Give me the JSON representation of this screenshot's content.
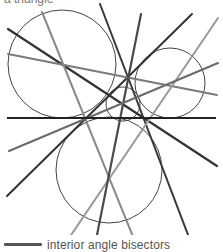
{
  "caption_top": "a triangle",
  "legend": {
    "label": "interior angle bisectors",
    "swatch_color": "#555555"
  },
  "figure": {
    "baseline": {
      "x1": 7,
      "y1": 118,
      "x2": 216,
      "y2": 118,
      "color": "#222222",
      "width": 2
    },
    "circles": [
      {
        "name": "incircle",
        "cx": 123,
        "cy": 104,
        "r": 17
      },
      {
        "name": "excircle-left",
        "cx": 62,
        "cy": 64,
        "r": 54
      },
      {
        "name": "excircle-right",
        "cx": 170,
        "cy": 83,
        "r": 35
      },
      {
        "name": "excircle-bottom",
        "cx": 109,
        "cy": 170,
        "r": 53
      }
    ],
    "lines": [
      {
        "name": "bisector-1",
        "x1": 8,
        "y1": 29,
        "x2": 217,
        "y2": 166,
        "color": "#333333",
        "width": 2.2
      },
      {
        "name": "bisector-2",
        "x1": 100,
        "y1": 4,
        "x2": 190,
        "y2": 240,
        "color": "#3a3a3a",
        "width": 2
      },
      {
        "name": "bisector-3",
        "x1": 192,
        "y1": 14,
        "x2": 7,
        "y2": 196,
        "color": "#333333",
        "width": 2
      },
      {
        "name": "bisector-4",
        "x1": 8,
        "y1": 54,
        "x2": 217,
        "y2": 95,
        "color": "#7a7a7a",
        "width": 2
      },
      {
        "name": "bisector-5",
        "x1": 42,
        "y1": 12,
        "x2": 136,
        "y2": 244,
        "color": "#888888",
        "width": 2
      },
      {
        "name": "bisector-6",
        "x1": 218,
        "y1": 18,
        "x2": 65,
        "y2": 244,
        "color": "#999999",
        "width": 2
      },
      {
        "name": "bisector-7",
        "x1": 141,
        "y1": 14,
        "x2": 96,
        "y2": 240,
        "color": "#4a4a4a",
        "width": 2.2
      },
      {
        "name": "bisector-8",
        "x1": 218,
        "y1": 63,
        "x2": 9,
        "y2": 151,
        "color": "#6a6a6a",
        "width": 2
      }
    ],
    "circle_color": "#444444",
    "circle_width": 1
  }
}
